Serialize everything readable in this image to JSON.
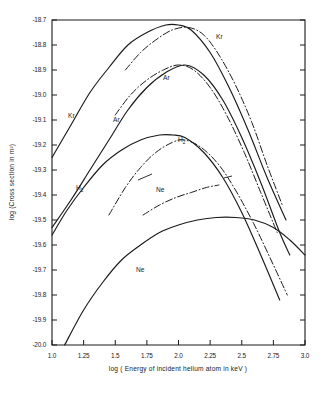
{
  "figure": {
    "background": "#ffffff",
    "ink_color": "#1a1a1a"
  },
  "axes": {
    "x_title": "log ( Energy of incident helium atom in keV )",
    "y_title": "log (Cross section in m²)",
    "x_ticklabels": [
      "1.0",
      "1.25",
      "1.5",
      "1.75",
      "2.0",
      "2.25",
      "2.5",
      "2.75",
      "3.0"
    ],
    "y_ticklabels": [
      "-18.7",
      "-18.8",
      "-18.9",
      "-19.0",
      "-19.1",
      "-19.2",
      "-19.3",
      "-19.4",
      "-19.5",
      "-19.6",
      "-19.7",
      "-19.8",
      "-19.9",
      "-20.0"
    ]
  },
  "labels": {
    "kr_solid": "Kr",
    "kr_dashdot": "Kr",
    "ar_solid": "Ar",
    "ar_dashdot": "Ar",
    "h2_solid_main": "H",
    "h2_solid_sub": "2",
    "h2_dashdot_main": "H",
    "h2_dashdot_sub": "2",
    "ne_solid": "Ne",
    "ne_dashdot": "Ne"
  },
  "chart_data": {
    "type": "line",
    "title": "",
    "xlabel": "log ( Energy of incident helium atom in keV )",
    "ylabel": "log (Cross section in m²)",
    "xlim": [
      1.0,
      3.0
    ],
    "ylim": [
      -20.0,
      -18.7
    ],
    "xticks": [
      1.0,
      1.25,
      1.5,
      1.75,
      2.0,
      2.25,
      2.5,
      2.75,
      3.0
    ],
    "yticks": [
      -20.0,
      -19.9,
      -19.8,
      -19.7,
      -19.6,
      -19.5,
      -19.4,
      -19.3,
      -19.2,
      -19.1,
      -19.0,
      -18.9,
      -18.8,
      -18.7
    ],
    "grid": false,
    "legend": "inline-curve-labels",
    "series": [
      {
        "name": "Kr",
        "style": "solid",
        "x": [
          1.0,
          1.15,
          1.3,
          1.45,
          1.6,
          1.75,
          1.9,
          2.0,
          2.1,
          2.25,
          2.4,
          2.55,
          2.7,
          2.85
        ],
        "y": [
          -19.25,
          -19.12,
          -18.99,
          -18.89,
          -18.8,
          -18.75,
          -18.72,
          -18.72,
          -18.74,
          -18.83,
          -18.97,
          -19.14,
          -19.33,
          -19.5
        ]
      },
      {
        "name": "Kr",
        "style": "dash-dot",
        "x": [
          1.58,
          1.7,
          1.82,
          1.95,
          2.08,
          2.2,
          2.32,
          2.45,
          2.58,
          2.7,
          2.82
        ],
        "y": [
          -18.9,
          -18.83,
          -18.78,
          -18.74,
          -18.73,
          -18.76,
          -18.84,
          -18.96,
          -19.11,
          -19.28,
          -19.44
        ]
      },
      {
        "name": "Ar",
        "style": "solid",
        "x": [
          1.0,
          1.15,
          1.3,
          1.45,
          1.6,
          1.75,
          1.9,
          2.05,
          2.2,
          2.35,
          2.5,
          2.65,
          2.8,
          2.88
        ],
        "y": [
          -19.53,
          -19.42,
          -19.3,
          -19.18,
          -19.06,
          -18.97,
          -18.91,
          -18.88,
          -18.92,
          -19.02,
          -19.17,
          -19.35,
          -19.55,
          -19.64
        ]
      },
      {
        "name": "Ar",
        "style": "dash-dot",
        "x": [
          1.5,
          1.62,
          1.75,
          1.88,
          2.0,
          2.12,
          2.25,
          2.38,
          2.52,
          2.65,
          2.78
        ],
        "y": [
          -19.08,
          -19.0,
          -18.94,
          -18.9,
          -18.88,
          -18.9,
          -18.97,
          -19.08,
          -19.23,
          -19.39,
          -19.55
        ]
      },
      {
        "name": "H2",
        "style": "solid",
        "x": [
          1.0,
          1.12,
          1.25,
          1.4,
          1.55,
          1.7,
          1.85,
          1.95,
          2.05,
          2.2,
          2.35,
          2.5,
          2.65,
          2.8
        ],
        "y": [
          -19.56,
          -19.46,
          -19.37,
          -19.28,
          -19.22,
          -19.18,
          -19.16,
          -19.16,
          -19.17,
          -19.23,
          -19.33,
          -19.47,
          -19.64,
          -19.82
        ]
      },
      {
        "name": "H2",
        "style": "dash-dot",
        "x": [
          1.45,
          1.58,
          1.7,
          1.82,
          1.95,
          2.05,
          2.18,
          2.32,
          2.45,
          2.6,
          2.75,
          2.86
        ],
        "y": [
          -19.48,
          -19.37,
          -19.29,
          -19.23,
          -19.19,
          -19.18,
          -19.21,
          -19.28,
          -19.38,
          -19.52,
          -19.68,
          -19.8
        ]
      },
      {
        "name": "Ne",
        "style": "solid",
        "x": [
          1.1,
          1.25,
          1.4,
          1.55,
          1.7,
          1.85,
          2.0,
          2.15,
          2.3,
          2.45,
          2.6,
          2.75,
          2.88,
          3.0
        ],
        "y": [
          -20.0,
          -19.86,
          -19.75,
          -19.66,
          -19.6,
          -19.55,
          -19.52,
          -19.5,
          -19.49,
          -19.49,
          -19.5,
          -19.53,
          -19.58,
          -19.64
        ]
      },
      {
        "name": "Ne",
        "style": "dash-dot",
        "x": [
          1.72,
          1.85,
          1.98,
          2.1,
          2.22,
          2.32
        ],
        "y": [
          -19.48,
          -19.44,
          -19.41,
          -19.39,
          -19.37,
          -19.36
        ]
      }
    ]
  }
}
